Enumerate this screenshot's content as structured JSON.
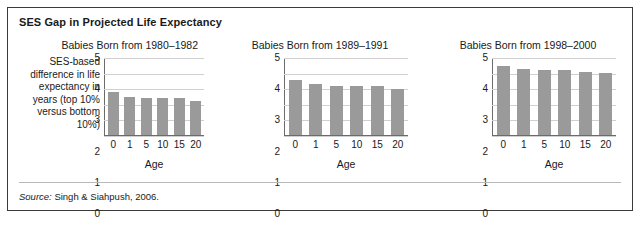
{
  "figure": {
    "title": "SES Gap in Projected Life Expectancy",
    "y_axis_label": "SES-based difference in life expectancy in years (top 10% versus bottom 10%)",
    "source_prefix": "Source:",
    "source_text": " Singh & Siahpush, 2006.",
    "bar_color": "#9a9a9a",
    "gridline_color": "#d0d0d0",
    "axis_color": "#6b6b6b",
    "border_color": "#3a3a3a"
  },
  "chart_data": [
    {
      "type": "bar",
      "title": "Babies Born from 1980–1982",
      "categories": [
        "0",
        "1",
        "5",
        "10",
        "15",
        "20"
      ],
      "values": [
        2.8,
        2.5,
        2.4,
        2.4,
        2.4,
        2.2
      ],
      "xlabel": "Age",
      "ylabel": "SES-based difference in life expectancy in years (top 10% versus bottom 10%)",
      "ylim": [
        0,
        5
      ],
      "yticks": [
        "5",
        "4",
        "3",
        "2",
        "1",
        "0"
      ],
      "grid": true,
      "legend": "none"
    },
    {
      "type": "bar",
      "title": "Babies Born from 1989–1991",
      "categories": [
        "0",
        "1",
        "5",
        "10",
        "15",
        "20"
      ],
      "values": [
        3.55,
        3.3,
        3.2,
        3.2,
        3.2,
        3.0
      ],
      "xlabel": "Age",
      "ylabel": "",
      "ylim": [
        0,
        5
      ],
      "yticks": [
        "5",
        "4",
        "3",
        "2",
        "1",
        "0"
      ],
      "grid": true,
      "legend": "none"
    },
    {
      "type": "bar",
      "title": "Babies Born from 1998–2000",
      "categories": [
        "0",
        "1",
        "5",
        "10",
        "15",
        "20"
      ],
      "values": [
        4.45,
        4.3,
        4.2,
        4.2,
        4.1,
        4.0
      ],
      "xlabel": "Age",
      "ylabel": "",
      "ylim": [
        0,
        5
      ],
      "yticks": [
        "5",
        "4",
        "3",
        "2",
        "1",
        "0"
      ],
      "grid": true,
      "legend": "none"
    }
  ]
}
